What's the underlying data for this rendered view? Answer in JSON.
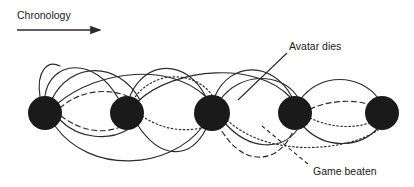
{
  "figure": {
    "background_color": "#ffffff",
    "node_color": "#1a1a1a",
    "line_color": "#2b2b2b",
    "text_color": "#1a1a1a"
  },
  "axis": {
    "label": "Chronology",
    "arrow_name": "chronology-arrow",
    "direction": "left-to-right"
  },
  "annotations": [
    {
      "id": "avatar-dies",
      "label": "Avatar dies",
      "leader_style": "solid",
      "target_x": 238,
      "target_y": 100
    },
    {
      "id": "game-beaten",
      "label": "Game beaten",
      "leader_style": "dashed",
      "target_x": 268,
      "target_y": 131
    }
  ],
  "nodes": [
    {
      "id": "n1",
      "label": "",
      "cx": 45,
      "cy": 113,
      "r": 17
    },
    {
      "id": "n2",
      "label": "",
      "cx": 127,
      "cy": 113,
      "r": 17
    },
    {
      "id": "n3",
      "label": "",
      "cx": 212,
      "cy": 113,
      "r": 18
    },
    {
      "id": "n4",
      "label": "",
      "cx": 295,
      "cy": 113,
      "r": 17
    },
    {
      "id": "n5",
      "label": "",
      "cx": 382,
      "cy": 113,
      "r": 17
    }
  ],
  "edge_styles": {
    "solid": "solid",
    "dashed": "dashed",
    "dotted": "dotted"
  },
  "edges": [
    {
      "id": "e1",
      "from": "n1",
      "to": "n2",
      "style": "solid",
      "arc": "above",
      "path": "M45,96 C50,60 95,56 118,98"
    },
    {
      "id": "e2",
      "from": "n1",
      "to": "n2",
      "style": "solid",
      "arc": "above",
      "path": "M52,99 C70,62 118,60 140,100"
    },
    {
      "id": "e3",
      "from": "n1",
      "to": "n3",
      "style": "solid",
      "arc": "above",
      "path": "M57,104 C100,68 172,64 205,96"
    },
    {
      "id": "e4",
      "from": "n1",
      "to": "n2",
      "style": "dashed",
      "arc": "above",
      "path": "M60,108 C80,90 108,88 127,96"
    },
    {
      "id": "e5",
      "from": "n1",
      "to": "n2",
      "style": "solid",
      "arc": "below",
      "path": "M60,120 C80,140 110,140 127,130"
    },
    {
      "id": "e6",
      "from": "n1",
      "to": "n2",
      "style": "dashed",
      "arc": "below",
      "path": "M61,116 C85,134 108,134 127,124"
    },
    {
      "id": "e7",
      "from": "n1",
      "to": "n3",
      "style": "solid",
      "arc": "below",
      "path": "M55,126 C90,175 170,170 203,126"
    },
    {
      "id": "e8",
      "from": "n2",
      "to": "n3",
      "style": "solid",
      "arc": "above",
      "path": "M130,96 C145,60 186,58 206,97"
    },
    {
      "id": "e9",
      "from": "n2",
      "to": "n3",
      "style": "dotted",
      "arc": "above",
      "path": "M133,100 C152,70 194,70 212,95"
    },
    {
      "id": "e10",
      "from": "n2",
      "to": "n4",
      "style": "solid",
      "arc": "above",
      "path": "M137,102 C175,66 258,62 290,97"
    },
    {
      "id": "e11",
      "from": "n2",
      "to": "n3",
      "style": "dotted",
      "arc": "below",
      "path": "M142,116 C165,132 190,132 208,126"
    },
    {
      "id": "e12",
      "from": "n2",
      "to": "n3",
      "style": "solid",
      "arc": "below",
      "path": "M137,124 C160,160 190,160 206,129"
    },
    {
      "id": "e13",
      "from": "n3",
      "to": "n4",
      "style": "solid",
      "arc": "above",
      "path": "M215,96 C230,62 272,60 292,97"
    },
    {
      "id": "e14",
      "from": "n3",
      "to": "n4",
      "style": "solid",
      "arc": "above",
      "path": "M220,100 C240,72 280,72 297,96"
    },
    {
      "id": "e15",
      "from": "n3",
      "to": "n4",
      "style": "dashed",
      "arc": "below",
      "path": "M218,124 C240,168 278,166 293,131"
    },
    {
      "id": "e16",
      "from": "n3",
      "to": "n4",
      "style": "solid",
      "arc": "below",
      "path": "M224,122 C250,152 282,150 297,130"
    },
    {
      "id": "e17",
      "from": "n3",
      "to": "n5",
      "style": "dotted",
      "arc": "below",
      "path": "M227,120 C270,160 350,150 378,130"
    },
    {
      "id": "e18",
      "from": "n4",
      "to": "n5",
      "style": "solid",
      "arc": "above",
      "path": "M300,100 C320,72 360,74 378,98"
    },
    {
      "id": "e19",
      "from": "n4",
      "to": "n5",
      "style": "dashed",
      "arc": "above",
      "path": "M310,109 C335,98 362,100 375,107"
    },
    {
      "id": "e20",
      "from": "n4",
      "to": "n5",
      "style": "dotted",
      "arc": "below",
      "path": "M310,118 C335,130 362,128 375,120"
    },
    {
      "id": "e21",
      "from": "n4",
      "to": "n5",
      "style": "solid",
      "arc": "below",
      "path": "M303,126 C325,150 360,148 378,128"
    },
    {
      "id": "e22",
      "from": "n1",
      "to": "n1",
      "style": "solid",
      "arc": "above",
      "path": "M40,97 C36,70 48,60 60,66"
    }
  ]
}
